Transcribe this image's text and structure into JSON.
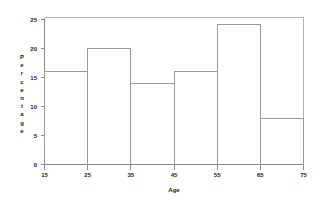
{
  "chart_data": {
    "type": "bar",
    "title": "",
    "subtitle": "",
    "xlabel": "Age",
    "ylabel": "Percentage",
    "categories": [
      "15-25",
      "25-35",
      "35-45",
      "45-55",
      "55-65",
      "65-75"
    ],
    "bin_edges": [
      15,
      25,
      35,
      45,
      55,
      65,
      75
    ],
    "values": [
      16.3,
      20.4,
      14.3,
      16.3,
      24.5,
      8.1
    ],
    "xlim": [
      15,
      75
    ],
    "ylim": [
      0,
      25.8
    ],
    "xticks": [
      "15",
      "25",
      "35",
      "45",
      "55",
      "65",
      "75"
    ],
    "xtick_values": [
      15,
      25,
      35,
      45,
      55,
      65,
      75
    ],
    "yticks": [
      "0",
      "5",
      "10",
      "15",
      "20",
      "25"
    ],
    "ytick_values": [
      0,
      5,
      10,
      15,
      20,
      25
    ],
    "grid": false,
    "legend": null,
    "legend_position": "none",
    "bar_fill": "none",
    "bar_stroke": "#9a9a9a",
    "axis_color": "#8a8a8a",
    "frame_color": "#b5b5b5",
    "text_color": "#1a1a1a",
    "background": "#ffffff",
    "annotations": []
  },
  "ylabel_letters": [
    "P",
    "e",
    "r",
    "c",
    "e",
    "n",
    "t",
    "a",
    "g",
    "e"
  ]
}
